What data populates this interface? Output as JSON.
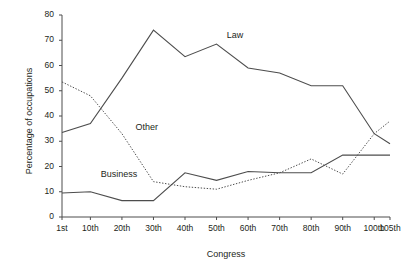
{
  "chart_data": {
    "type": "line",
    "title": "",
    "xlabel": "Congress",
    "ylabel": "Percentage of occupations",
    "categories": [
      "1st",
      "10th",
      "20th",
      "30th",
      "40th",
      "50th",
      "60th",
      "70th",
      "80th",
      "90th",
      "100th",
      "105th"
    ],
    "x_numeric": [
      1,
      10,
      20,
      30,
      40,
      50,
      60,
      70,
      80,
      90,
      100,
      105
    ],
    "xlim": [
      1,
      105
    ],
    "ylim": [
      0,
      80
    ],
    "y_ticks": [
      0,
      10,
      20,
      30,
      40,
      50,
      60,
      70,
      80
    ],
    "grid": false,
    "legend_position": "inline-annotations",
    "series": [
      {
        "name": "Law",
        "style": "solid",
        "color": "#4d4d4d",
        "values": [
          33.5,
          37,
          55,
          74,
          63.5,
          68.5,
          59,
          57,
          52,
          52,
          33,
          29
        ]
      },
      {
        "name": "Business",
        "style": "solid",
        "color": "#4d4d4d",
        "values": [
          9.5,
          10,
          6.5,
          6.5,
          17.5,
          14.5,
          18,
          17.5,
          17.5,
          24.5,
          24.5,
          24.5
        ]
      },
      {
        "name": "Other",
        "style": "dotted",
        "color": "#4d4d4d",
        "values": [
          53.5,
          48,
          33,
          14,
          12,
          11,
          14.5,
          17.5,
          23,
          17,
          33,
          38
        ]
      }
    ],
    "annotations": [
      {
        "text": "Law",
        "x": 52,
        "y": 68.5
      },
      {
        "text": "Other",
        "x": 23,
        "y": 32
      },
      {
        "text": "Business",
        "x": 12,
        "y": 13.5
      }
    ]
  },
  "axis": {
    "y_tick_labels": [
      "80",
      "70",
      "60",
      "50",
      "40",
      "30",
      "20",
      "10",
      "0"
    ],
    "x_tick_labels": [
      "1st",
      "10th",
      "20th",
      "30th",
      "40th",
      "50th",
      "60th",
      "70th",
      "80th",
      "90th",
      "100th",
      "105th"
    ],
    "x_title": "Congress",
    "y_title": "Percentage of occupations"
  }
}
